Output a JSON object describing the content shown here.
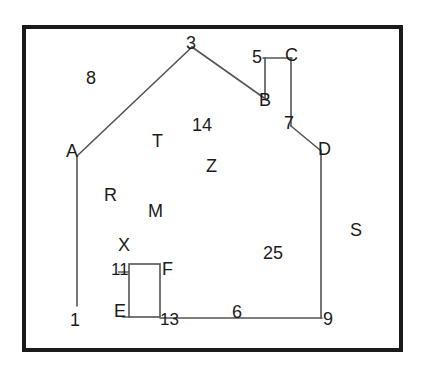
{
  "figure": {
    "width": 427,
    "height": 373,
    "background_color": "#ffffff",
    "border_color": "#1a1a1a",
    "line_color": "#4d4d4d",
    "text_color": "#1b1b1b",
    "frame": {
      "x": 22,
      "y": 25,
      "width": 381,
      "height": 327,
      "stroke_width": 4
    }
  },
  "shapes": {
    "left_roof": {
      "name": "left-roof-line",
      "x1": 77,
      "y1": 156,
      "x2": 192,
      "y2": 47
    },
    "right_roof": {
      "name": "right-roof-line",
      "x1": 192,
      "y1": 47,
      "x2": 267,
      "y2": 100
    },
    "chimney_top": {
      "name": "chimney-top-line",
      "x1": 263,
      "y1": 58,
      "x2": 291,
      "y2": 58
    },
    "chimney_left": {
      "name": "chimney-left-line",
      "x1": 265,
      "y1": 58,
      "x2": 265,
      "y2": 99
    },
    "chimney_right": {
      "name": "chimney-right-line",
      "x1": 291,
      "y1": 58,
      "x2": 291,
      "y2": 126
    },
    "eave_right": {
      "name": "right-eave-line",
      "x1": 291,
      "y1": 126,
      "x2": 320,
      "y2": 150
    },
    "right_wall": {
      "name": "right-wall-line",
      "x1": 321,
      "y1": 150,
      "x2": 321,
      "y2": 318
    },
    "left_wall": {
      "name": "left-wall-line",
      "x1": 77,
      "y1": 157,
      "x2": 77,
      "y2": 306
    },
    "floor": {
      "name": "floor-line",
      "x1": 160,
      "y1": 318,
      "x2": 321,
      "y2": 318
    },
    "door": {
      "name": "door-rectangle",
      "x": 129,
      "y": 264,
      "width": 31,
      "height": 53
    }
  },
  "labels": [
    {
      "id": "label-8",
      "text": "8",
      "x": 86,
      "y": 69,
      "size": "sz-lg"
    },
    {
      "id": "label-3",
      "text": "3",
      "x": 186,
      "y": 34,
      "size": "sz-lg"
    },
    {
      "id": "label-5",
      "text": "5",
      "x": 252,
      "y": 48,
      "size": "sz-lg"
    },
    {
      "id": "label-C",
      "text": "C",
      "x": 285,
      "y": 46,
      "size": "sz-lg"
    },
    {
      "id": "label-B",
      "text": "B",
      "x": 259,
      "y": 91,
      "size": "sz-lg"
    },
    {
      "id": "label-7",
      "text": "7",
      "x": 284,
      "y": 114,
      "size": "sz-lg"
    },
    {
      "id": "label-D",
      "text": "D",
      "x": 318,
      "y": 140,
      "size": "sz-lg"
    },
    {
      "id": "label-14",
      "text": "14",
      "x": 192,
      "y": 116,
      "size": "sz-lg"
    },
    {
      "id": "label-T",
      "text": "T",
      "x": 152,
      "y": 132,
      "size": "sz-lg"
    },
    {
      "id": "label-A",
      "text": "A",
      "x": 66,
      "y": 142,
      "size": "sz-lg"
    },
    {
      "id": "label-Z",
      "text": "Z",
      "x": 206,
      "y": 157,
      "size": "sz-lg"
    },
    {
      "id": "label-R",
      "text": "R",
      "x": 104,
      "y": 186,
      "size": "sz-lg"
    },
    {
      "id": "label-M",
      "text": "M",
      "x": 148,
      "y": 202,
      "size": "sz-lg"
    },
    {
      "id": "label-S",
      "text": "S",
      "x": 350,
      "y": 221,
      "size": "sz-lg"
    },
    {
      "id": "label-X",
      "text": "X",
      "x": 118,
      "y": 236,
      "size": "sz-lg"
    },
    {
      "id": "label-25",
      "text": "25",
      "x": 263,
      "y": 244,
      "size": "sz-lg"
    },
    {
      "id": "label-11",
      "text": "11",
      "x": 111,
      "y": 261,
      "size": "sz-md"
    },
    {
      "id": "label-F",
      "text": "F",
      "x": 162,
      "y": 260,
      "size": "sz-lg"
    },
    {
      "id": "label-E",
      "text": "E",
      "x": 114,
      "y": 302,
      "size": "sz-lg"
    },
    {
      "id": "label-13",
      "text": "13",
      "x": 160,
      "y": 311,
      "size": "sz-md"
    },
    {
      "id": "label-6",
      "text": "6",
      "x": 232,
      "y": 303,
      "size": "sz-lg"
    },
    {
      "id": "label-9",
      "text": "9",
      "x": 323,
      "y": 310,
      "size": "sz-lg"
    },
    {
      "id": "label-1",
      "text": "1",
      "x": 70,
      "y": 311,
      "size": "sz-lg"
    }
  ]
}
